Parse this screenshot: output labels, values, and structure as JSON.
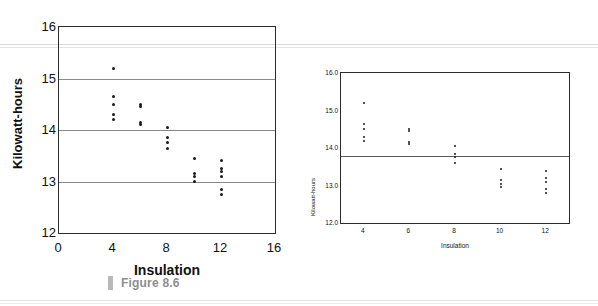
{
  "figure": {
    "caption": "Figure 8.6",
    "caption_mark": "bar-mark"
  },
  "chart_data": [
    {
      "id": "left",
      "type": "scatter",
      "title": "",
      "xlabel": "Insulation",
      "ylabel": "Kilowatt-hours",
      "xlim": [
        0,
        16
      ],
      "ylim": [
        12,
        16
      ],
      "xticks": [
        0,
        4,
        8,
        12,
        16
      ],
      "yticks": [
        12,
        13,
        14,
        15,
        16
      ],
      "grid": "horizontal gridlines at y = 13, 14, 15",
      "gridlines": [
        13,
        14,
        15
      ],
      "legend": "none",
      "points": [
        {
          "x": 4,
          "y": 15.2
        },
        {
          "x": 4,
          "y": 14.65
        },
        {
          "x": 4,
          "y": 14.5
        },
        {
          "x": 4,
          "y": 14.3
        },
        {
          "x": 4,
          "y": 14.2
        },
        {
          "x": 6,
          "y": 14.5
        },
        {
          "x": 6,
          "y": 14.45
        },
        {
          "x": 6,
          "y": 14.15
        },
        {
          "x": 6,
          "y": 14.1
        },
        {
          "x": 8,
          "y": 14.05
        },
        {
          "x": 8,
          "y": 13.85
        },
        {
          "x": 8,
          "y": 13.75
        },
        {
          "x": 8,
          "y": 13.65
        },
        {
          "x": 10,
          "y": 13.45
        },
        {
          "x": 10,
          "y": 13.15
        },
        {
          "x": 10,
          "y": 13.1
        },
        {
          "x": 10,
          "y": 13.0
        },
        {
          "x": 12,
          "y": 13.4
        },
        {
          "x": 12,
          "y": 13.25
        },
        {
          "x": 12,
          "y": 13.2
        },
        {
          "x": 12,
          "y": 13.1
        },
        {
          "x": 12,
          "y": 12.85
        },
        {
          "x": 12,
          "y": 12.75
        }
      ]
    },
    {
      "id": "right",
      "type": "scatter",
      "title": "",
      "xlabel": "Insulation",
      "ylabel": "Kilowatt-hours",
      "xlim": [
        3,
        13
      ],
      "ylim": [
        12.0,
        16.0
      ],
      "xticks": [
        4,
        6,
        8,
        10,
        12
      ],
      "yticks": [
        12.0,
        13.0,
        14.0,
        15.0,
        16.0
      ],
      "grid": "single horizontal reference line near y = 13.8",
      "gridlines": [
        13.8
      ],
      "legend": "none",
      "points": [
        {
          "x": 4,
          "y": 15.2
        },
        {
          "x": 4,
          "y": 14.65
        },
        {
          "x": 4,
          "y": 14.5
        },
        {
          "x": 4,
          "y": 14.3
        },
        {
          "x": 4,
          "y": 14.2
        },
        {
          "x": 6,
          "y": 14.5
        },
        {
          "x": 6,
          "y": 14.45
        },
        {
          "x": 6,
          "y": 14.15
        },
        {
          "x": 6,
          "y": 14.1
        },
        {
          "x": 8,
          "y": 14.05
        },
        {
          "x": 8,
          "y": 13.85
        },
        {
          "x": 8,
          "y": 13.75
        },
        {
          "x": 8,
          "y": 13.6
        },
        {
          "x": 10,
          "y": 13.45
        },
        {
          "x": 10,
          "y": 13.15
        },
        {
          "x": 10,
          "y": 13.05
        },
        {
          "x": 10,
          "y": 12.95
        },
        {
          "x": 12,
          "y": 13.4
        },
        {
          "x": 12,
          "y": 13.2
        },
        {
          "x": 12,
          "y": 13.1
        },
        {
          "x": 12,
          "y": 12.9
        },
        {
          "x": 12,
          "y": 12.8
        }
      ]
    }
  ],
  "left_axis": {
    "yticks": [
      "16",
      "15",
      "14",
      "13",
      "12"
    ],
    "xticks": [
      "0",
      "4",
      "8",
      "12",
      "16"
    ],
    "xlabel": "Insulation",
    "ylabel": "Kilowatt-hours"
  },
  "right_axis": {
    "yticks": [
      "16.0",
      "15.0",
      "14.0",
      "13.0",
      "12.0"
    ],
    "xticks": [
      "4",
      "6",
      "8",
      "10",
      "12"
    ],
    "xlabel": "Insulation",
    "ylabel": "Kilowatt-hours"
  }
}
